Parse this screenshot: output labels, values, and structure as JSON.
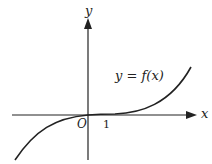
{
  "diagram": {
    "type": "function-graph",
    "axes": {
      "x_label": "x",
      "y_label": "y",
      "origin_label": "O",
      "tick_labels": [
        "1"
      ]
    },
    "curve": {
      "label": "y = f(x)",
      "description": "Increasing curve through the origin, concave down for x<0, flattening near x = 1, then rising steeply for x > 1"
    },
    "colors": {
      "ink": "#222222",
      "background": "#ffffff"
    }
  }
}
